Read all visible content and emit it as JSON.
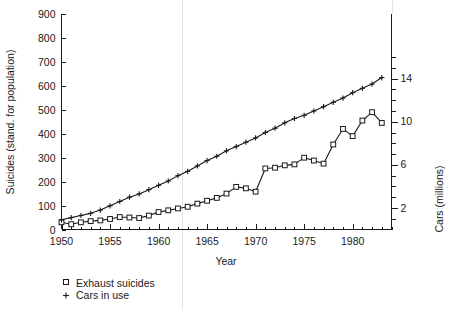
{
  "chart_data": {
    "type": "line",
    "title": "",
    "subtitle": "",
    "xlabel": "Year",
    "ylabel": "Suicides (stand. for population)",
    "y2label": "Cars (millions)",
    "xlim": [
      1950,
      1984
    ],
    "ylim": [
      0,
      900
    ],
    "y2lim": [
      0,
      20
    ],
    "grid": false,
    "legend_position": "below-left",
    "xticks": [
      1950,
      1955,
      1960,
      1965,
      1970,
      1975,
      1980
    ],
    "xtick_labels": [
      "1950",
      "1955",
      "1960",
      "1965",
      "1970",
      "1975",
      "1980"
    ],
    "xminor_step": 1,
    "yticks": [
      0,
      100,
      200,
      300,
      400,
      500,
      600,
      700,
      800,
      900
    ],
    "ytick_labels": [
      "0",
      "100",
      "200",
      "300",
      "400",
      "500",
      "600",
      "700",
      "800",
      "900"
    ],
    "y2ticks": [
      2,
      6,
      10,
      14
    ],
    "y2tick_labels": [
      "2",
      "6",
      "10",
      "14"
    ],
    "y2minor_step": 1,
    "x": [
      1950,
      1951,
      1952,
      1953,
      1954,
      1955,
      1956,
      1957,
      1958,
      1959,
      1960,
      1961,
      1962,
      1963,
      1964,
      1965,
      1966,
      1967,
      1968,
      1969,
      1970,
      1971,
      1972,
      1973,
      1974,
      1975,
      1976,
      1977,
      1978,
      1979,
      1980,
      1981,
      1982,
      1983
    ],
    "series": [
      {
        "name": "Exhaust suicides",
        "marker": "square",
        "axis": "left",
        "values": [
          30,
          22,
          30,
          35,
          38,
          44,
          52,
          50,
          48,
          58,
          73,
          80,
          88,
          95,
          108,
          120,
          132,
          150,
          178,
          172,
          158,
          255,
          258,
          268,
          272,
          300,
          288,
          275,
          355,
          420,
          390,
          455,
          490,
          445
        ]
      },
      {
        "name": "Cars in use",
        "marker": "plus",
        "axis": "right",
        "values": [
          0.9,
          1.1,
          1.3,
          1.5,
          1.8,
          2.2,
          2.6,
          3.0,
          3.3,
          3.7,
          4.1,
          4.5,
          5.0,
          5.4,
          5.9,
          6.4,
          6.8,
          7.3,
          7.7,
          8.1,
          8.5,
          9.0,
          9.4,
          9.9,
          10.3,
          10.6,
          11.0,
          11.4,
          11.8,
          12.2,
          12.7,
          13.1,
          13.5,
          14.1
        ]
      }
    ],
    "annotations": []
  },
  "legend": {
    "entries": [
      {
        "marker": "square-open",
        "label": "Exhaust suicides"
      },
      {
        "marker": "plus",
        "label": "Cars in use"
      }
    ]
  },
  "colors": {
    "ink": "#1a1a1a",
    "background": "#ffffff",
    "faint_rule": "#e3e3e6"
  }
}
